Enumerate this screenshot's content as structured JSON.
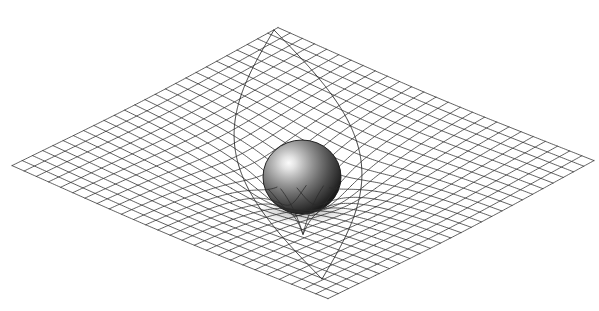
{
  "figure": {
    "title": "Spacetime curvature around a massive body",
    "background_color": "#ffffff",
    "width": 599,
    "height": 311
  },
  "grid": {
    "name": "spacetime-grid",
    "shape": "rhombus",
    "divisions_u": 26,
    "divisions_v": 26,
    "line_color": "#2b2b2b",
    "line_width": 0.75,
    "corner_left": [
      12,
      163
    ],
    "corner_top": [
      278,
      25
    ],
    "corner_right": [
      586,
      165
    ],
    "corner_bottom": [
      328,
      296
    ],
    "center": [
      301,
      162
    ]
  },
  "well": {
    "name": "gravity-well",
    "center_u": 0.5,
    "center_v": 0.5,
    "depth_px": 74,
    "radius": 0.3,
    "softening": 0.085
  },
  "sphere": {
    "name": "massive-body",
    "center_x": 302,
    "center_y": 177,
    "radius_x": 39,
    "radius_y": 37,
    "highlight_x": "33%",
    "highlight_y": "31%",
    "highlight_color": "#f2f2f2",
    "mid_color": "#8a8a8a",
    "edge_color": "#2a2a2a",
    "rim_color": "#151515"
  },
  "geodesics": {
    "name": "light-cone-lines",
    "line_color": "#191919",
    "line_width": 0.85,
    "apex_top": [
      274,
      30
    ],
    "apex_bottom": [
      322,
      279
    ],
    "lines": [
      {
        "label": "left-geodesic",
        "from": [
          274,
          30
        ],
        "to": [
          322,
          279
        ]
      },
      {
        "label": "right-geodesic",
        "from": [
          274,
          30
        ],
        "to": [
          322,
          279
        ]
      }
    ]
  }
}
